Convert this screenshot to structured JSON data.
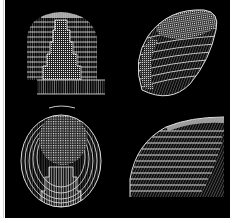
{
  "figure": {
    "layout": "2x2 grid of wireframe mesh renderings",
    "background": "#000000",
    "mesh_color": "#e6e6e6",
    "panels": [
      {
        "position": "top-left",
        "view": "front",
        "description": "dome-shaped wireframe with horizontal bands and a stepped central column"
      },
      {
        "position": "top-right",
        "view": "oblique-top",
        "description": "egg-shaped wireframe tilted, dense mesh on top cap"
      },
      {
        "position": "bottom-left",
        "view": "top-down",
        "description": "oval wireframe seen from above with circular dense cap and stepped lower section"
      },
      {
        "position": "bottom-right",
        "view": "side",
        "description": "quarter-dome profile with horizontal stacked bands"
      }
    ]
  }
}
